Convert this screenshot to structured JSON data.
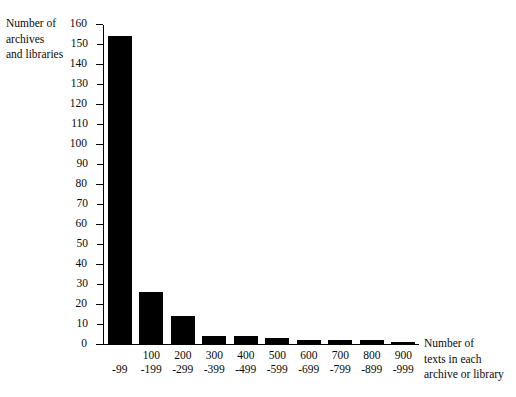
{
  "chart_data": {
    "type": "bar",
    "title": "",
    "xlabel": "Number of texts in each archive or library",
    "ylabel": "Number of archives and libraries",
    "categories": [
      "-99",
      "100-199",
      "200-299",
      "300-399",
      "400-499",
      "500-599",
      "600-699",
      "700-799",
      "800-899",
      "900-999"
    ],
    "category_lines": [
      {
        "line1": "",
        "line2": "-99"
      },
      {
        "line1": "100",
        "line2": "-199"
      },
      {
        "line1": "200",
        "line2": "-299"
      },
      {
        "line1": "300",
        "line2": "-399"
      },
      {
        "line1": "400",
        "line2": "-499"
      },
      {
        "line1": "500",
        "line2": "-599"
      },
      {
        "line1": "600",
        "line2": "-699"
      },
      {
        "line1": "700",
        "line2": "-799"
      },
      {
        "line1": "800",
        "line2": "-899"
      },
      {
        "line1": "900",
        "line2": "-999"
      }
    ],
    "values": [
      154,
      26,
      14,
      4,
      4,
      3,
      2,
      2,
      2,
      1
    ],
    "ylim": [
      0,
      160
    ],
    "ytick_step": 10,
    "yticks": [
      0,
      10,
      20,
      30,
      40,
      50,
      60,
      70,
      80,
      90,
      100,
      110,
      120,
      130,
      140,
      150,
      160
    ],
    "ytick_labels": [
      "0",
      "10",
      "20",
      "30",
      "40",
      "50",
      "60",
      "70",
      "80",
      "90",
      "100",
      "110",
      "120",
      "130",
      "140",
      "150",
      "160"
    ],
    "grid": false,
    "legend": false,
    "bar_color": "#000000",
    "background_color": "#ffffff",
    "axis_color": "#000000"
  },
  "axes": {
    "y_title": "Number of\narchives\nand libraries",
    "x_title": "Number of\ntexts in each\narchive or library"
  }
}
